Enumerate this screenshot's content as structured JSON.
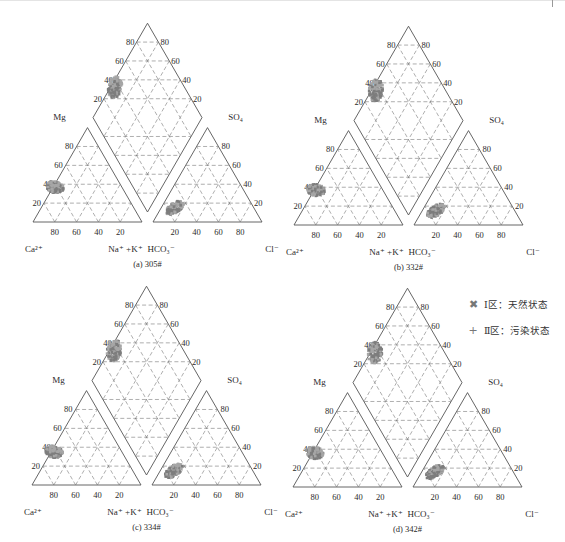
{
  "chart_data": {
    "type": "scatter",
    "subtype": "piper_trilinear_diagram",
    "title": "",
    "axes": {
      "cation_triangle": {
        "corners": [
          "Ca2+",
          "Mg",
          "Na+ + K+"
        ],
        "bottom_ticks": [
          80,
          60,
          40,
          20
        ],
        "left_ticks": [
          20,
          40,
          60,
          80
        ]
      },
      "anion_triangle": {
        "corners": [
          "HCO3-",
          "SO4",
          "Cl-"
        ],
        "bottom_ticks": [
          20,
          40,
          60,
          80
        ],
        "right_ticks": [
          20,
          40,
          60,
          80
        ]
      },
      "diamond": {
        "left_ticks": [
          20,
          40,
          60,
          80
        ],
        "right_ticks": [
          20,
          40,
          60,
          80
        ]
      }
    },
    "legend": [
      {
        "symbol": "x",
        "label": "Ⅰ区：天然状态",
        "color": "#8a8a8a"
      },
      {
        "symbol": "+",
        "label": "Ⅱ区：污染状态",
        "color": "#a9a9a9"
      }
    ],
    "panels": [
      {
        "id": "a",
        "caption": "(a) 305#",
        "cation_cluster": {
          "Ca": [
            50,
            62
          ],
          "Mg": [
            30,
            40
          ]
        },
        "anion_cluster": {
          "Cl": [
            12,
            30
          ],
          "SO4": [
            8,
            22
          ]
        },
        "diamond_cluster": {
          "SO4_Cl": [
            22,
            38
          ],
          "Mg_Ca": [
            8,
            26
          ]
        }
      },
      {
        "id": "b",
        "caption": "(b) 332#",
        "cation_cluster": {
          "Ca": [
            48,
            60
          ],
          "Mg": [
            30,
            40
          ]
        },
        "anion_cluster": {
          "Cl": [
            10,
            32
          ],
          "SO4": [
            8,
            22
          ]
        },
        "diamond_cluster": {
          "SO4_Cl": [
            18,
            34
          ],
          "Mg_Ca": [
            8,
            30
          ]
        }
      },
      {
        "id": "c",
        "caption": "(c) 334#",
        "cation_cluster": {
          "Ca": [
            46,
            60
          ],
          "Mg": [
            22,
            44
          ]
        },
        "anion_cluster": {
          "Cl": [
            10,
            30
          ],
          "SO4": [
            8,
            22
          ]
        },
        "diamond_cluster": {
          "SO4_Cl": [
            24,
            36
          ],
          "Mg_Ca": [
            8,
            30
          ]
        }
      },
      {
        "id": "d",
        "caption": "(d) 342#",
        "cation_cluster": {
          "Ca": [
            50,
            62
          ],
          "Mg": [
            28,
            40
          ]
        },
        "anion_cluster": {
          "Cl": [
            10,
            28
          ],
          "SO4": [
            10,
            22
          ]
        },
        "diamond_cluster": {
          "SO4_Cl": [
            18,
            32
          ],
          "Mg_Ca": [
            14,
            28
          ]
        }
      }
    ]
  },
  "labels": {
    "ca": "Ca²⁺",
    "mg": "Mg",
    "nak": "Na⁺ +K⁺",
    "hco3": "HCO₃⁻",
    "so4": "SO₄",
    "cl": "Cl⁻"
  },
  "legend": {
    "item1": {
      "symbol": "✖",
      "label": "Ⅰ区：天然状态"
    },
    "item2": {
      "symbol": "+",
      "label": "Ⅱ区：污染状态"
    }
  },
  "layout": {
    "panels": [
      {
        "id": "a",
        "ox": 33,
        "base": 222,
        "cap": "(a) 305#"
      },
      {
        "id": "b",
        "ox": 294,
        "base": 225,
        "cap": "(b) 332#"
      },
      {
        "id": "c",
        "ox": 32,
        "base": 485,
        "cap": "(c) 334#"
      },
      {
        "id": "d",
        "ox": 293,
        "base": 487,
        "cap": "(d) 342#"
      }
    ],
    "colors": {
      "line": "#555555",
      "dash": "#777777",
      "clusterA": "#7d7d7d",
      "clusterB": "#a6a6a6"
    }
  }
}
